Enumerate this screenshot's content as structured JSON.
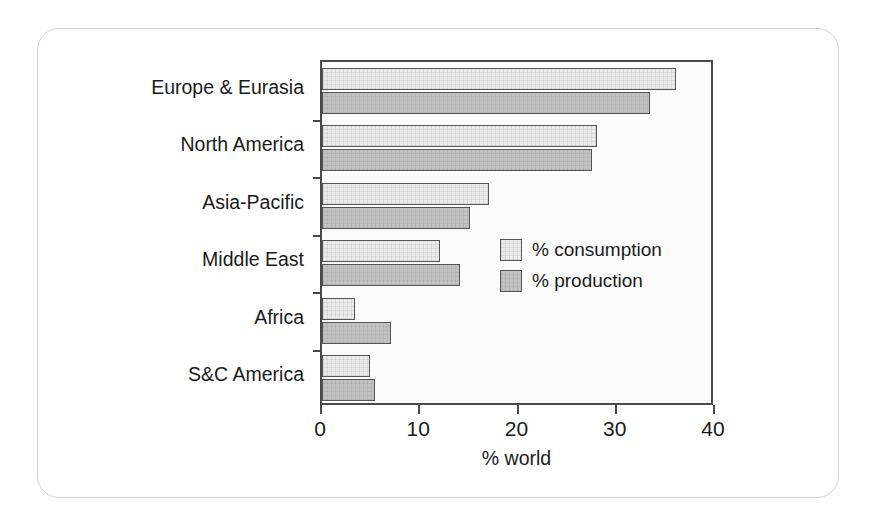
{
  "card": {
    "border_color": "#d2d2d2"
  },
  "chart_data": {
    "type": "bar",
    "orientation": "horizontal",
    "title": "",
    "xlabel": "% world",
    "ylabel": "",
    "xlim": [
      0,
      40
    ],
    "xticks": [
      0,
      10,
      20,
      30,
      40
    ],
    "xticklabels": [
      "0",
      "10",
      "20",
      "30",
      "40"
    ],
    "grid": false,
    "legend_position": "inside-right-middle",
    "categories": [
      "Europe & Eurasia",
      "North America",
      "Asia-Pacific",
      "Middle East",
      "Africa",
      "S&C America"
    ],
    "series": [
      {
        "name": "% consumption",
        "color": "#ebebeb",
        "edge_color": "#555555",
        "values": [
          36.0,
          28.0,
          17.0,
          12.0,
          3.4,
          4.9
        ]
      },
      {
        "name": "% production",
        "color": "#c2c2c2",
        "edge_color": "#555555",
        "values": [
          33.4,
          27.5,
          15.1,
          14.0,
          7.0,
          5.4
        ]
      }
    ]
  },
  "legend": {
    "entries": [
      {
        "label": "% consumption",
        "swatch": "consumption"
      },
      {
        "label": "% production",
        "swatch": "production"
      }
    ]
  }
}
